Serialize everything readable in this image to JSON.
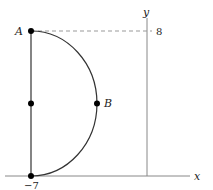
{
  "diagram": {
    "axes": {
      "x_label": "x",
      "y_label": "y"
    },
    "ticks": {
      "y_tick": "8",
      "x_tick": "−7"
    },
    "points": {
      "A": "A",
      "B": "B"
    },
    "colors": {
      "stroke": "#333333",
      "axis": "#888888",
      "dashed": "#999999",
      "point": "#000000"
    }
  }
}
